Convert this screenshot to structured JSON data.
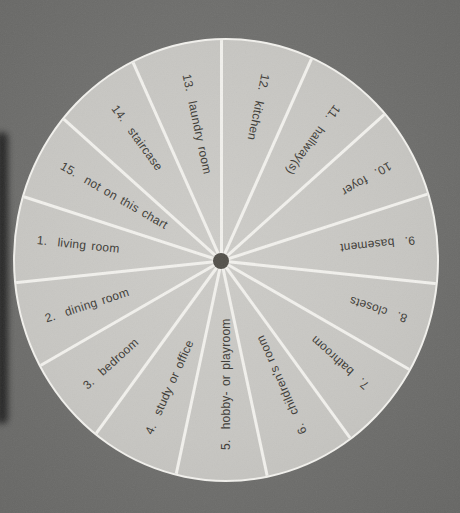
{
  "page": {
    "background_color": "#6e6e6c",
    "wheel_fill_color": "#c7c6c2",
    "spoke_color": "#f2f1ed",
    "hub_color": "#53514b",
    "label_text_color": "#3c3a35",
    "gutter_shadow_color": "#1c1c1c"
  },
  "chart_data": {
    "type": "pie",
    "title": "",
    "subtitle": "",
    "legend": "none",
    "equal_segments": true,
    "segment_count": 15,
    "segment_angle_deg": 24,
    "values": [
      1,
      1,
      1,
      1,
      1,
      1,
      1,
      1,
      1,
      1,
      1,
      1,
      1,
      1,
      1
    ],
    "boundary_angles_deg": [
      0,
      24,
      48,
      72,
      96,
      120,
      144,
      168,
      192,
      216,
      240,
      264,
      288,
      312,
      336
    ],
    "segments": [
      {
        "number": "1",
        "name": "living room",
        "display": "1.  living room",
        "angle_center_deg": 276
      },
      {
        "number": "2",
        "name": "dining room",
        "display": "2.  dining room",
        "angle_center_deg": 252
      },
      {
        "number": "3",
        "name": "bedroom",
        "display": "3.  bedroom",
        "angle_center_deg": 228
      },
      {
        "number": "4",
        "name": "study or office",
        "display": "4.  study or office",
        "angle_center_deg": 204
      },
      {
        "number": "5",
        "name": "hobby- or playroom",
        "display": "5.  hobby- or playroom",
        "angle_center_deg": 180
      },
      {
        "number": "6",
        "name": "children's room",
        "display": "6.  children's room",
        "angle_center_deg": 156
      },
      {
        "number": "7",
        "name": "bathroom",
        "display": "7.  bathroom",
        "angle_center_deg": 132
      },
      {
        "number": "8",
        "name": "closets",
        "display": "8.  closets",
        "angle_center_deg": 108
      },
      {
        "number": "9",
        "name": "basement",
        "display": "9.  basement",
        "angle_center_deg": 84
      },
      {
        "number": "10",
        "name": "foyer",
        "display": "10.  foyer",
        "angle_center_deg": 60
      },
      {
        "number": "11",
        "name": "hallway(s)",
        "display": "11.  hallway(s)",
        "angle_center_deg": 36
      },
      {
        "number": "12",
        "name": "kitchen",
        "display": "12.  kitchen",
        "angle_center_deg": 12
      },
      {
        "number": "13",
        "name": "laundry room",
        "display": "13.  laundry room",
        "angle_center_deg": 348
      },
      {
        "number": "14",
        "name": "staircase",
        "display": "14.  staircase",
        "angle_center_deg": 324
      },
      {
        "number": "15",
        "name": "not on this chart",
        "display": "15.  not on this chart",
        "angle_center_deg": 300
      }
    ],
    "label_style": "labels run along each radius, number at the rim, reading toward the center (labels on the right half appear upside down)"
  }
}
